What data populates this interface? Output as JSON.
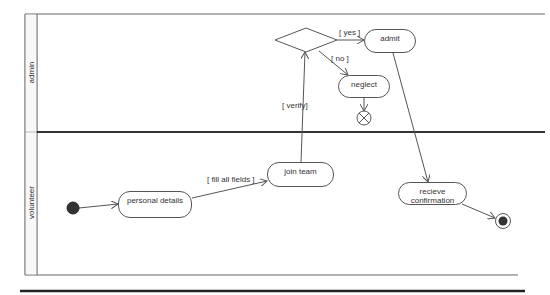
{
  "diagram": {
    "type": "UML activity diagram with swimlanes",
    "lanes": [
      {
        "id": "admin",
        "label": "admin"
      },
      {
        "id": "volunteer",
        "label": "volunteer"
      }
    ],
    "nodes": {
      "initial": {
        "kind": "initial",
        "lane": "volunteer"
      },
      "personal_details": {
        "kind": "action",
        "label": "personal details",
        "lane": "volunteer"
      },
      "join_team": {
        "kind": "action",
        "label": "join team",
        "lane": "volunteer"
      },
      "decision": {
        "kind": "decision",
        "lane": "admin"
      },
      "admit": {
        "kind": "action",
        "label": "admit",
        "lane": "admin"
      },
      "neglect": {
        "kind": "action",
        "label": "neglect",
        "lane": "admin"
      },
      "flow_final": {
        "kind": "flow-final",
        "lane": "admin"
      },
      "receive_confirmation": {
        "kind": "action",
        "label": "recieve confirmation",
        "lane": "volunteer"
      },
      "activity_final": {
        "kind": "activity-final",
        "lane": "volunteer"
      }
    },
    "edges": [
      {
        "from": "initial",
        "to": "personal_details",
        "guard": ""
      },
      {
        "from": "personal_details",
        "to": "join_team",
        "guard": "[ fill all fields ]"
      },
      {
        "from": "join_team",
        "to": "decision",
        "guard": "[ verify]"
      },
      {
        "from": "decision",
        "to": "admit",
        "guard": "[ yes ]"
      },
      {
        "from": "decision",
        "to": "neglect",
        "guard": "[ no ]"
      },
      {
        "from": "neglect",
        "to": "flow_final",
        "guard": ""
      },
      {
        "from": "admit",
        "to": "receive_confirmation",
        "guard": ""
      },
      {
        "from": "receive_confirmation",
        "to": "activity_final",
        "guard": ""
      }
    ],
    "guards": {
      "fill_all_fields": "[ fill all fields ]",
      "verify": "[ verify]",
      "yes": "[ yes ]",
      "no": "[ no ]"
    },
    "colors": {
      "line": "#555555",
      "divider": "#333333",
      "node_fill": "#ffffff",
      "initial_fill": "#333333"
    }
  }
}
